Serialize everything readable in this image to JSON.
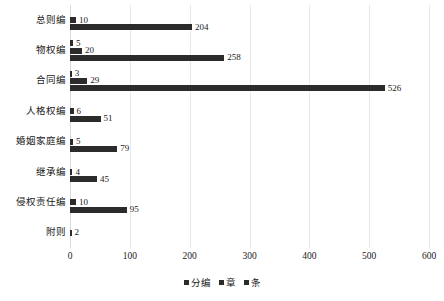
{
  "chart_data": {
    "type": "bar",
    "orientation": "horizontal",
    "title": "",
    "xlabel": "",
    "ylabel": "",
    "xlim": [
      0,
      600
    ],
    "xticks": [
      0,
      100,
      200,
      300,
      400,
      500,
      600
    ],
    "grid": true,
    "legend_position": "bottom",
    "categories": [
      "总则编",
      "物权编",
      "合同编",
      "人格权编",
      "婚姻家庭编",
      "继承编",
      "侵权责任编",
      "附则"
    ],
    "series": [
      {
        "name": "分编",
        "values": [
          null,
          5,
          3,
          null,
          null,
          null,
          null,
          null
        ]
      },
      {
        "name": "章",
        "values": [
          10,
          20,
          29,
          6,
          5,
          4,
          10,
          2
        ]
      },
      {
        "name": "条",
        "values": [
          204,
          258,
          526,
          51,
          79,
          45,
          95,
          null
        ]
      }
    ]
  },
  "legend": {
    "items": [
      {
        "label": "分编",
        "color": "#2b2b2b"
      },
      {
        "label": "章",
        "color": "#2b2b2b"
      },
      {
        "label": "条",
        "color": "#2b2b2b"
      }
    ]
  },
  "axis": {
    "x_tick_labels": [
      "0",
      "100",
      "200",
      "300",
      "400",
      "500",
      "600"
    ]
  },
  "caption": {
    "text": ""
  },
  "colors": {
    "bar": "#2b2b2b",
    "gridline": "#e8e8e8",
    "background": "#ffffff",
    "text": "#1a1a1a"
  }
}
